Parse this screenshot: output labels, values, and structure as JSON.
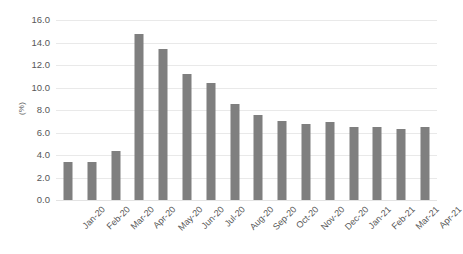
{
  "chart_data": {
    "type": "bar",
    "title": "",
    "subtitle": "",
    "xlabel": "",
    "ylabel": "(%)",
    "grid": true,
    "legend": false,
    "legend_position": "none",
    "bar_color": "#7f7f7f",
    "grid_color": "#e9e9e9",
    "text_color": "#575757",
    "ylim": [
      0.0,
      16.0
    ],
    "ytick_step": 2.0,
    "ytick_labels": [
      "16.0",
      "14.0",
      "12.0",
      "10.0",
      "8.0",
      "6.0",
      "4.0",
      "2.0",
      "0.0"
    ],
    "ytick_values": [
      16.0,
      14.0,
      12.0,
      10.0,
      8.0,
      6.0,
      4.0,
      2.0,
      0.0
    ],
    "categories": [
      "Jan-20",
      "Feb-20",
      "Mar-20",
      "Apr-20",
      "May-20",
      "Jun-20",
      "Jul-20",
      "Aug-20",
      "Sep-20",
      "Oct-20",
      "Nov-20",
      "Dec-20",
      "Jan-21",
      "Feb-21",
      "Mar-21",
      "Apr-21"
    ],
    "values": [
      3.4,
      3.4,
      4.4,
      14.8,
      13.4,
      11.2,
      10.4,
      8.5,
      7.6,
      7.0,
      6.8,
      6.9,
      6.5,
      6.5,
      6.3,
      6.5
    ]
  }
}
